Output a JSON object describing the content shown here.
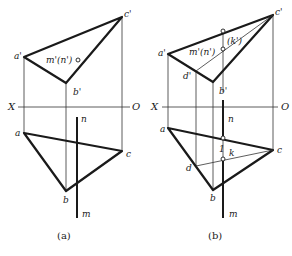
{
  "figure": {
    "panels": [
      {
        "caption": "(a)",
        "labels": {
          "c_prime": "c'",
          "a_prime": "a'",
          "b_prime": "b'",
          "mn_prime": "m'(n')",
          "x_axis": "X",
          "o_axis": "O",
          "n": "n",
          "a": "a",
          "c": "c",
          "b": "b",
          "m": "m"
        }
      },
      {
        "caption": "(b)",
        "labels": {
          "c_prime": "c'",
          "a_prime": "a'",
          "b_prime": "b'",
          "mn_prime": "m'(n')",
          "k_prime": "(k')",
          "d_prime": "d'",
          "x_axis": "X",
          "o_axis": "O",
          "n": "n",
          "a": "a",
          "c": "c",
          "b": "b",
          "d": "d",
          "k": "k",
          "one": "1",
          "m": "m"
        }
      }
    ],
    "colors": {
      "line": "#1a1a1a",
      "thin": "#333333",
      "background": "#ffffff"
    }
  }
}
